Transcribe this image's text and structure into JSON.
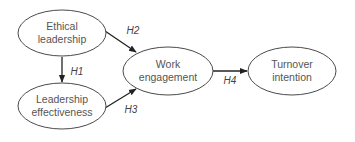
{
  "diagram": {
    "type": "path-model",
    "nodes": [
      {
        "id": "ethical",
        "lines": [
          "Ethical",
          "leadership"
        ],
        "cx": 62,
        "cy": 33,
        "rx": 44,
        "ry": 23
      },
      {
        "id": "effectiveness",
        "lines": [
          "Leadership",
          "effectiveness"
        ],
        "cx": 62,
        "cy": 106,
        "rx": 44,
        "ry": 23
      },
      {
        "id": "engagement",
        "lines": [
          "Work",
          "engagement"
        ],
        "cx": 168,
        "cy": 71,
        "rx": 45,
        "ry": 24
      },
      {
        "id": "turnover",
        "lines": [
          "Turnover",
          "intention"
        ],
        "cx": 292,
        "cy": 71,
        "rx": 44,
        "ry": 24
      }
    ],
    "edges": [
      {
        "from": "ethical",
        "to": "effectiveness",
        "label": "H1"
      },
      {
        "from": "ethical",
        "to": "engagement",
        "label": "H2"
      },
      {
        "from": "effectiveness",
        "to": "engagement",
        "label": "H3"
      },
      {
        "from": "engagement",
        "to": "turnover",
        "label": "H4"
      }
    ]
  },
  "labels": {
    "ethical_1": "Ethical",
    "ethical_2": "leadership",
    "effect_1": "Leadership",
    "effect_2": "effectiveness",
    "engage_1": "Work",
    "engage_2": "engagement",
    "turn_1": "Turnover",
    "turn_2": "intention",
    "h1": "H1",
    "h2": "H2",
    "h3": "H3",
    "h4": "H4"
  }
}
